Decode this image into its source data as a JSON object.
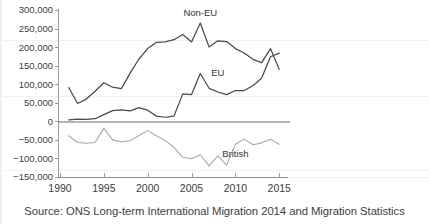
{
  "caption": {
    "source_text": "Source: ONS Long-term International Migration 2014 and Migration Statistics"
  },
  "chart_data": {
    "type": "line",
    "title": "",
    "xlabel": "",
    "ylabel": "",
    "xlim": [
      1990,
      2016
    ],
    "ylim": [
      -150000,
      300000
    ],
    "grid": false,
    "legend_position": "inline-annotations",
    "y_ticks": [
      300000,
      250000,
      200000,
      150000,
      100000,
      50000,
      0,
      -50000,
      -100000,
      -150000
    ],
    "y_tick_labels": [
      "300,000",
      "250,000",
      "200,000",
      "150,000",
      "100,000",
      "50,000",
      "0",
      "-50,000",
      "-100,000",
      "-150,000"
    ],
    "x_ticks": [
      1990,
      1995,
      2000,
      2005,
      2010,
      2015
    ],
    "x_tick_labels": [
      "1990",
      "1995",
      "2000",
      "2005",
      "2010",
      "2015"
    ],
    "x": [
      1991,
      1992,
      1993,
      1994,
      1995,
      1996,
      1997,
      1998,
      1999,
      2000,
      2001,
      2002,
      2003,
      2004,
      2005,
      2006,
      2007,
      2008,
      2009,
      2010,
      2011,
      2012,
      2013,
      2014,
      2015
    ],
    "series": [
      {
        "name": "Non-EU",
        "label": "Non-EU",
        "color": "#4a4a4a",
        "values": [
          91000,
          48000,
          60000,
          81000,
          104000,
          92000,
          88000,
          130000,
          168000,
          196000,
          213000,
          214000,
          220000,
          234000,
          214000,
          265000,
          200000,
          217000,
          215000,
          196000,
          184000,
          167000,
          158000,
          196000,
          140000
        ]
      },
      {
        "name": "EU",
        "label": "EU",
        "color": "#4a4a4a",
        "values": [
          4000,
          6000,
          5000,
          7000,
          18000,
          29000,
          31000,
          28000,
          37000,
          30000,
          14000,
          11000,
          14000,
          74000,
          72000,
          129000,
          89000,
          79000,
          72000,
          83000,
          83000,
          96000,
          117000,
          174000,
          184000
        ]
      },
      {
        "name": "British",
        "label": "British",
        "color": "#a8a8a8",
        "values": [
          -39000,
          -57000,
          -59000,
          -57000,
          -19000,
          -50000,
          -55000,
          -52000,
          -38000,
          -25000,
          -39000,
          -52000,
          -70000,
          -97000,
          -101000,
          -90000,
          -120000,
          -93000,
          -118000,
          -62000,
          -48000,
          -63000,
          -58000,
          -48000,
          -62000
        ]
      }
    ],
    "annotations": [
      {
        "text": "Non-EU",
        "x": 2006,
        "y": 283000
      },
      {
        "text": "EU",
        "x": 2008,
        "y": 122000
      },
      {
        "text": "British",
        "x": 2010,
        "y": -95000
      }
    ]
  }
}
